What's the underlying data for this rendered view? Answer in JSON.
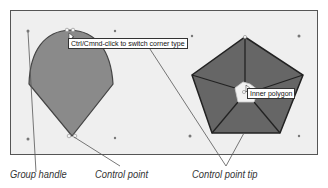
{
  "canvas": {
    "background": "#efefef",
    "border_color": "#555555"
  },
  "shapes": {
    "teardrop": {
      "fill": "#8a8a8a",
      "stroke": "#444444"
    },
    "pentagon": {
      "fill": "#666666",
      "stroke": "#222222",
      "inner_fill": "#f2f2f2"
    }
  },
  "tooltips": {
    "corner_type": "Ctrl/Cmnd-click to switch corner type",
    "inner_polygon": "Inner polygon"
  },
  "captions": {
    "group_handle": "Group handle",
    "control_point": "Control point",
    "control_point_tip": "Control point tip"
  }
}
